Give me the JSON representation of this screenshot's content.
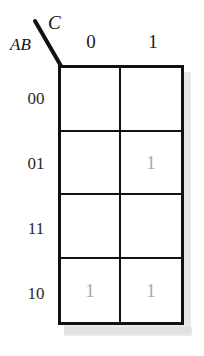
{
  "diagram": {
    "type": "karnaugh-map",
    "column_variable": "C",
    "row_variable": "AB",
    "column_headers": [
      "0",
      "1"
    ],
    "row_headers": [
      "00",
      "01",
      "11",
      "10"
    ],
    "cells": [
      {
        "row": "00",
        "col": "0",
        "value": ""
      },
      {
        "row": "00",
        "col": "1",
        "value": ""
      },
      {
        "row": "01",
        "col": "0",
        "value": ""
      },
      {
        "row": "01",
        "col": "1",
        "value": "1"
      },
      {
        "row": "11",
        "col": "0",
        "value": ""
      },
      {
        "row": "11",
        "col": "1",
        "value": ""
      },
      {
        "row": "10",
        "col": "0",
        "value": "1"
      },
      {
        "row": "10",
        "col": "1",
        "value": "1"
      }
    ],
    "colors": {
      "grid_line": "#111111",
      "value_text": "#a8a8a8",
      "label_text": "#1a1a1a",
      "shadow": "#d6d6d6",
      "background": "#ffffff"
    }
  }
}
